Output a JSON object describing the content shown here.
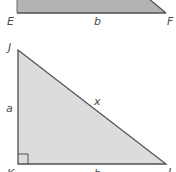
{
  "colors": {
    "background": "#ffffff",
    "trapezoid_fill": "#b3b3b3",
    "triangle_fill": "#dcdcdc",
    "stroke": "#505050",
    "label": "#4a4a4a"
  },
  "top_figure": {
    "vertex_labels": {
      "bottom_left": "E",
      "bottom_right": "F"
    },
    "side_labels": {
      "bottom": "b"
    }
  },
  "bottom_figure": {
    "vertex_labels": {
      "top": "J",
      "right_angle": "K",
      "bottom_right": "L"
    },
    "side_labels": {
      "vertical_leg": "a",
      "hypotenuse": "x",
      "horizontal_leg": "b"
    },
    "right_angle_marker": true
  }
}
